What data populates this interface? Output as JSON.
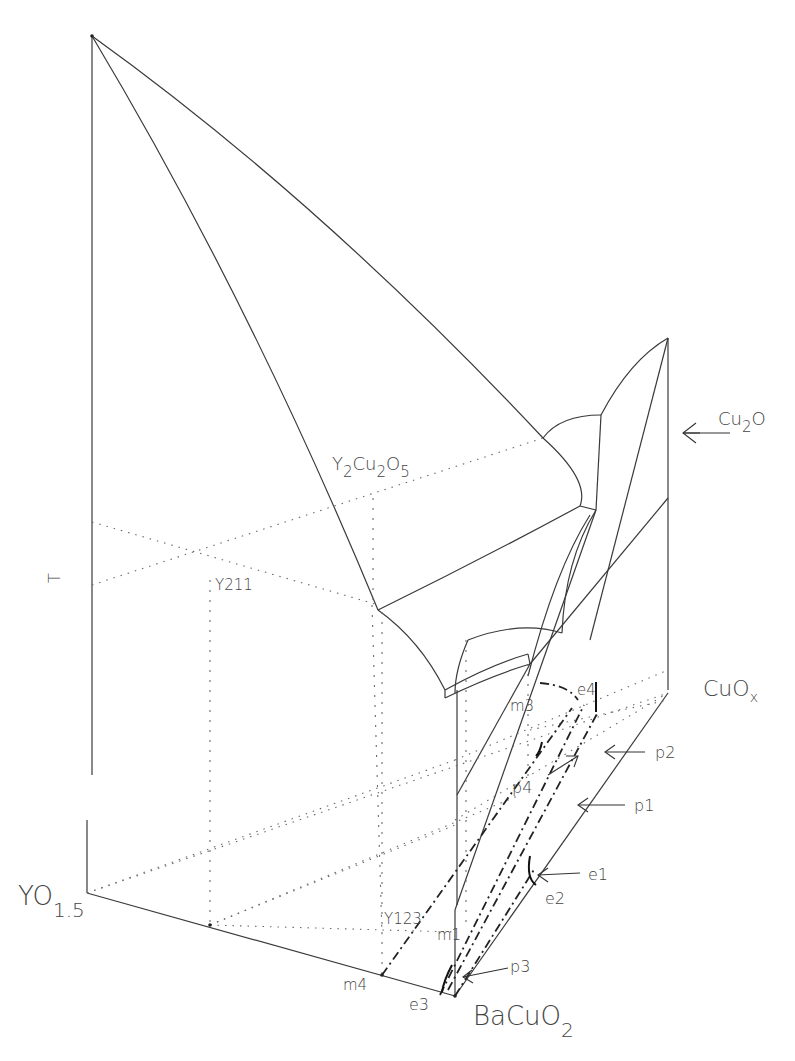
{
  "figure": {
    "type": "ternary-temperature phase diagram (Y-Ba-Cu-O liquidus projection)",
    "axis_labels": {
      "temperature": "T",
      "corner_yo15": {
        "main": "YO",
        "sub": "1.5"
      },
      "corner_bacuo2": {
        "main": "BaCuO",
        "sub": "2"
      },
      "corner_cuox": {
        "main": "CuO",
        "sub": "x"
      }
    },
    "phase_labels": {
      "y2cu2o5": {
        "parts": [
          "Y",
          "2",
          "Cu",
          "2",
          "O",
          "5"
        ]
      },
      "y211": "Y211",
      "y123": "Y123",
      "cu2o": {
        "main": "Cu",
        "sub": "2",
        "tail": "O"
      }
    },
    "invariant_points": {
      "e1": "e1",
      "e2": "e2",
      "e3": "e3",
      "e4": "e4",
      "p1": "p1",
      "p2": "p2",
      "p3": "p3",
      "p4": "p4",
      "m1": "m1",
      "m3": "m3",
      "m4": "m4"
    },
    "colors": {
      "line": "#3a3a3a",
      "text": "#444444",
      "background": "#ffffff"
    }
  }
}
